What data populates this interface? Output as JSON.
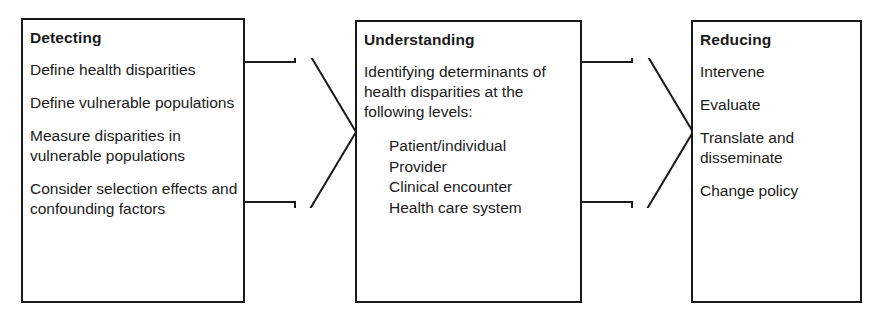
{
  "diagram": {
    "stages": [
      {
        "id": "detecting",
        "title": "Detecting",
        "items": [
          "Define health disparities",
          "Define vulnerable populations",
          "Measure disparities in vulnerable populations",
          "Consider selection effects and confounding factors"
        ]
      },
      {
        "id": "understanding",
        "title": "Understanding",
        "lead": "Identifying determinants of health disparities at the following levels:",
        "levels": [
          "Patient/individual",
          "Provider",
          "Clinical encounter",
          "Health care system"
        ]
      },
      {
        "id": "reducing",
        "title": "Reducing",
        "items": [
          "Intervene",
          "Evaluate",
          "Translate and disseminate",
          "Change policy"
        ]
      }
    ],
    "connectors": [
      {
        "id": "detecting-to-understanding",
        "icon": "right-arrow-icon"
      },
      {
        "id": "understanding-to-reducing",
        "icon": "right-arrow-icon"
      }
    ],
    "colors": {
      "stroke": "#1a1a1a",
      "fill": "#ffffff",
      "text": "#1a1a1a"
    }
  }
}
